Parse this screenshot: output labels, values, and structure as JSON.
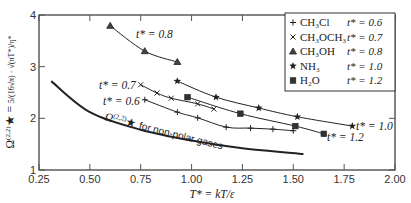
{
  "chart_data": {
    "type": "line",
    "title": "",
    "xlabel": "T* = kT/ε",
    "ylabel": "Ω(2,2)* = (5/(16√π)) · √(πT*)/η*",
    "xlim": [
      0.25,
      2.0
    ],
    "ylim": [
      1,
      4
    ],
    "x_ticks": [
      "0.25",
      "0.50",
      "0.75",
      "1.00",
      "1.25",
      "1.50",
      "1.75",
      "2.00"
    ],
    "y_ticks": [
      "1",
      "2",
      "3",
      "4"
    ],
    "grid": false,
    "legend_position": "upper right",
    "series": [
      {
        "name": "CH3Cl",
        "t_star": "t* = 0.6",
        "marker": "+",
        "x": [
          0.77,
          0.93,
          1.03,
          1.17,
          1.29,
          1.4,
          1.5
        ],
        "y": [
          2.36,
          2.12,
          2.01,
          1.83,
          1.81,
          1.79,
          1.76
        ]
      },
      {
        "name": "CH3OCH3",
        "t_star": "t* = 0.7",
        "marker": "x",
        "x": [
          0.75,
          0.83,
          0.9,
          1.03,
          1.11
        ],
        "y": [
          2.65,
          2.49,
          2.39,
          2.28,
          2.18
        ]
      },
      {
        "name": "CH3OH",
        "t_star": "t* = 0.8",
        "marker": "triangle",
        "x": [
          0.6,
          0.77,
          0.93
        ],
        "y": [
          3.79,
          3.3,
          3.09
        ]
      },
      {
        "name": "NH3",
        "t_star": "t* = 1.0",
        "marker": "star",
        "x": [
          0.93,
          1.12,
          1.33,
          1.52,
          1.79
        ],
        "y": [
          2.72,
          2.41,
          2.2,
          2.03,
          1.85
        ]
      },
      {
        "name": "H2O",
        "t_star": "t* = 1.2",
        "marker": "square",
        "x": [
          0.98,
          1.24,
          1.51,
          1.65
        ],
        "y": [
          2.41,
          2.09,
          1.85,
          1.7
        ]
      },
      {
        "name": "Ω(2,2)* for non-polar gases",
        "marker": "none",
        "x": [
          0.31,
          0.5,
          0.75,
          1.0,
          1.25,
          1.55
        ],
        "y": [
          2.72,
          2.12,
          1.78,
          1.57,
          1.42,
          1.31
        ]
      }
    ],
    "annotations": [
      {
        "text": "t* = 0.8",
        "x": 0.78,
        "y": 3.62
      },
      {
        "text": "t* = 0.7",
        "x": 0.5,
        "y": 2.68
      },
      {
        "text": "t* = 0.6",
        "x": 0.52,
        "y": 2.36
      },
      {
        "text": "t* = 1.0",
        "x": 1.82,
        "y": 1.85
      },
      {
        "text": "t* = 1.2",
        "x": 1.67,
        "y": 1.66
      },
      {
        "text": "Ω(2,2)* for non-polar gases",
        "x": 0.45,
        "y": 1.75
      }
    ]
  },
  "axes": {
    "xlabel_text": "T* = kT/ε",
    "ylabel_text": "Ω(2,2)* = 5/(16√π) · √(πT*)/η*"
  },
  "legend": [
    {
      "species": "CH₃Cl",
      "t": "t* = 0.6",
      "marker": "+"
    },
    {
      "species": "CH₃OCH₃",
      "t": "t* = 0.7",
      "marker": "×"
    },
    {
      "species": "CH₃OH",
      "t": "t* = 0.8",
      "marker": "▲"
    },
    {
      "species": "NH₃",
      "t": "t* = 1.0",
      "marker": "★"
    },
    {
      "species": "H₂O",
      "t": "t* = 1.2",
      "marker": "■"
    }
  ],
  "labels": {
    "t08": "t* = 0.8",
    "t07": "t* = 0.7",
    "t06": "t* = 0.6",
    "t10": "t* = 1.0",
    "t12": "t* = 1.2",
    "nonpolar": "for non-polar gases",
    "omega": "Ω",
    "omega_sup": "(2,2)",
    "star": "*"
  }
}
